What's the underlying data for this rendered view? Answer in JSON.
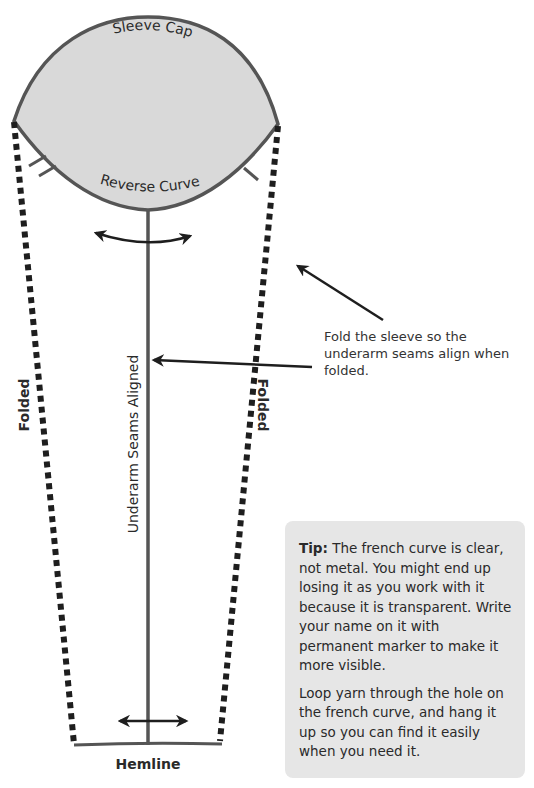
{
  "diagram": {
    "labels": {
      "sleeve_cap": "Sleeve Cap",
      "reverse_curve": "Reverse Curve",
      "underarm_seams": "Underarm Seams Aligned",
      "folded_left": "Folded",
      "folded_right": "Folded",
      "hemline": "Hemline"
    },
    "colors": {
      "cap_fill": "#d9d9d9",
      "outline": "#555555",
      "dashes": "#1e1e1e",
      "arrows": "#1e1e1e",
      "tip_bg": "#e6e6e6"
    }
  },
  "annotation": {
    "text": "Fold the sleeve so the underarm seams align when folded."
  },
  "tip_box": {
    "label": "Tip:",
    "paragraph1": " The french curve is clear, not metal. You might end up losing it as you work with it because it is transparent. Write your name on it with permanent marker to make it more visible.",
    "paragraph2": "Loop yarn through the hole on the french curve, and hang it up so you can find it easily when you need it."
  }
}
